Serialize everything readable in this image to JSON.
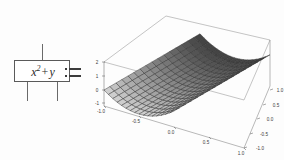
{
  "formula_block": {
    "expression_base": "x",
    "expression_exponent": "2",
    "expression_operator": "+",
    "expression_operand": "y",
    "expression_full": "x2 + y"
  },
  "assignment": {
    "symbol": ":="
  },
  "plot": {
    "surface_label": "3d-surface-mesh",
    "z_axis": {
      "ticks": [
        "2",
        "1",
        "0",
        "-1"
      ]
    },
    "x_axis": {
      "ticks": [
        "-1.0",
        "-0.5",
        "0.0",
        "0.5",
        "1.0"
      ]
    },
    "y_axis": {
      "ticks": [
        "-1.0",
        "-0.5",
        "0.0",
        "0.5",
        "1.0"
      ]
    },
    "corner_label": "-1.0"
  },
  "colors": {
    "line": "#5a5a5a",
    "text": "#2b2b2b",
    "mesh_light": "#cfcfcf",
    "mesh_dark": "#5e5e5e",
    "mesh_edge": "#2f2f2f",
    "background": "#fdfdfd"
  },
  "chart_data": {
    "type": "surface",
    "title": "",
    "function": "z = x^2 + y",
    "xlabel": "x",
    "ylabel": "y",
    "zlabel": "z",
    "xlim": [
      -1,
      1
    ],
    "ylim": [
      -1,
      1
    ],
    "zlim": [
      -1,
      2
    ],
    "xticks": [
      -1.0,
      -0.5,
      0.0,
      0.5,
      1.0
    ],
    "yticks": [
      -1.0,
      -0.5,
      0.0,
      0.5,
      1.0
    ],
    "zticks": [
      -1,
      0,
      1,
      2
    ],
    "grid": true,
    "legend": false,
    "mesh_n": 16,
    "colormap": "grayscale"
  }
}
